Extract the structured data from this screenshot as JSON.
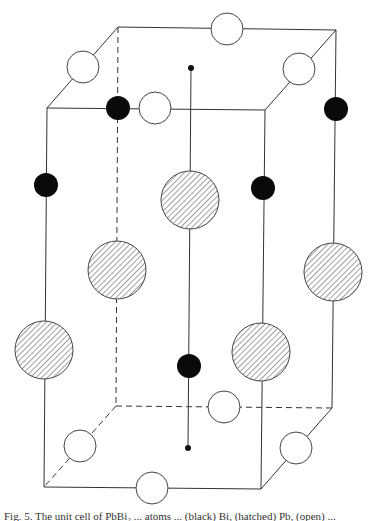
{
  "figure": {
    "caption": "Fig. 5.  The unit cell of PbBi₂ ... atoms ... (black) Bi, (hatched) Pb, (open) ...",
    "box": {
      "top": {
        "back_left": [
          118,
          27
        ],
        "back_right": [
          336,
          30
        ],
        "front_left": [
          47,
          108
        ],
        "front_right": [
          265,
          110
        ]
      },
      "bottom": {
        "back_left": [
          116,
          406
        ],
        "back_right": [
          332,
          408
        ],
        "front_left": [
          44,
          487
        ],
        "front_right": [
          261,
          489
        ]
      }
    },
    "central_axis": {
      "x": 191,
      "top_dot": [
        191,
        68
      ],
      "bottom_dot": [
        188,
        448
      ]
    },
    "atoms": {
      "open": [
        {
          "cx": 227,
          "cy": 29,
          "r": 16
        },
        {
          "cx": 83,
          "cy": 67,
          "r": 16
        },
        {
          "cx": 299,
          "cy": 69,
          "r": 16
        },
        {
          "cx": 155,
          "cy": 108,
          "r": 16
        },
        {
          "cx": 224,
          "cy": 407,
          "r": 16
        },
        {
          "cx": 80,
          "cy": 446,
          "r": 16
        },
        {
          "cx": 296,
          "cy": 448,
          "r": 16
        },
        {
          "cx": 152,
          "cy": 488,
          "r": 16
        }
      ],
      "black": [
        {
          "cx": 118,
          "cy": 108,
          "r": 12
        },
        {
          "cx": 336,
          "cy": 109,
          "r": 12
        },
        {
          "cx": 46,
          "cy": 185,
          "r": 12
        },
        {
          "cx": 263,
          "cy": 188,
          "r": 12
        },
        {
          "cx": 189,
          "cy": 366,
          "r": 12
        }
      ],
      "hatched": [
        {
          "cx": 190,
          "cy": 200,
          "r": 29
        },
        {
          "cx": 117,
          "cy": 270,
          "r": 29
        },
        {
          "cx": 333,
          "cy": 272,
          "r": 29
        },
        {
          "cx": 44,
          "cy": 350,
          "r": 29
        },
        {
          "cx": 261,
          "cy": 352,
          "r": 29
        }
      ]
    }
  }
}
